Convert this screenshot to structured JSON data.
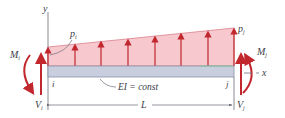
{
  "diagram": {
    "labels": {
      "y_axis": "y",
      "x_axis": "x",
      "load_start": "p",
      "load_start_sub": "i",
      "load_end": "p",
      "load_end_sub": "j",
      "moment_i": "M",
      "moment_i_sub": "i",
      "moment_j": "M",
      "moment_j_sub": "j",
      "shear_i": "V",
      "shear_i_sub": "i",
      "shear_j": "V",
      "shear_j_sub": "j",
      "node_i": "i",
      "node_j": "j",
      "stiffness": "EI = const",
      "length": "L"
    },
    "colors": {
      "load_fill": "#f7c9cf",
      "load_arrow": "#c1272d",
      "beam_fill": "#c9cede",
      "beam_edge": "#8a90a8",
      "axis": "#6b6f78",
      "text": "#3d4048"
    }
  }
}
